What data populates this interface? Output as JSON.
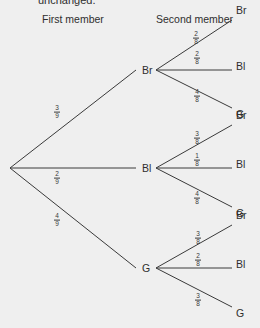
{
  "header": {
    "clipped_text": "unchanged.",
    "first_column_title": "First member",
    "second_column_title": "Second member"
  },
  "colors": {
    "background": "#efefef",
    "line": "#3a3a3a",
    "text": "#2e2e2e"
  },
  "tree": {
    "root": {
      "x": 10,
      "y": 168
    },
    "first_level": [
      {
        "label": "Br",
        "x": 142,
        "y": 70,
        "prob": {
          "num": "3",
          "den": "9"
        },
        "prob_pos": {
          "x": 57,
          "y": 112
        },
        "children": [
          {
            "label": "Br",
            "end_x": 232,
            "end_y": 20,
            "prob": {
              "num": "2",
              "den": "8"
            },
            "prob_pos": {
              "x": 196,
              "y": 38
            }
          },
          {
            "label": "Bl",
            "end_x": 232,
            "end_y": 70,
            "prob": {
              "num": "2",
              "den": "8"
            },
            "prob_pos": {
              "x": 197,
              "y": 58
            }
          },
          {
            "label": "G",
            "end_x": 232,
            "end_y": 108,
            "prob": {
              "num": "4",
              "den": "8"
            },
            "prob_pos": {
              "x": 197,
              "y": 96
            }
          }
        ]
      },
      {
        "label": "Bl",
        "x": 142,
        "y": 168,
        "prob": {
          "num": "2",
          "den": "9"
        },
        "prob_pos": {
          "x": 57,
          "y": 178
        },
        "children": [
          {
            "label": "Br",
            "end_x": 232,
            "end_y": 125,
            "prob": {
              "num": "3",
              "den": "8"
            },
            "prob_pos": {
              "x": 197,
              "y": 138
            }
          },
          {
            "label": "Bl",
            "end_x": 232,
            "end_y": 168,
            "prob": {
              "num": "1",
              "den": "8"
            },
            "prob_pos": {
              "x": 197,
              "y": 160
            }
          },
          {
            "label": "G",
            "end_x": 232,
            "end_y": 207,
            "prob": {
              "num": "4",
              "den": "8"
            },
            "prob_pos": {
              "x": 197,
              "y": 198
            }
          }
        ]
      },
      {
        "label": "G",
        "x": 142,
        "y": 268,
        "prob": {
          "num": "4",
          "den": "9"
        },
        "prob_pos": {
          "x": 57,
          "y": 220
        },
        "children": [
          {
            "label": "Br",
            "end_x": 232,
            "end_y": 225,
            "prob": {
              "num": "3",
              "den": "8"
            },
            "prob_pos": {
              "x": 198,
              "y": 238
            }
          },
          {
            "label": "Bl",
            "end_x": 232,
            "end_y": 268,
            "prob": {
              "num": "2",
              "den": "8"
            },
            "prob_pos": {
              "x": 198,
              "y": 260
            }
          },
          {
            "label": "G",
            "end_x": 232,
            "end_y": 307,
            "prob": {
              "num": "3",
              "den": "8"
            },
            "prob_pos": {
              "x": 198,
              "y": 300
            }
          }
        ]
      }
    ]
  }
}
